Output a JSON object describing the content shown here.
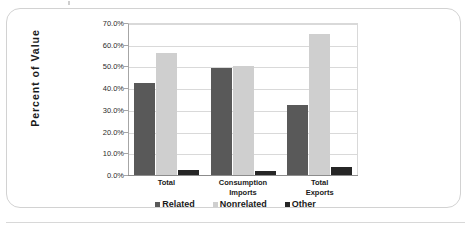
{
  "chart_data": {
    "type": "bar",
    "title": "",
    "subtitle": "",
    "xlabel": "",
    "ylabel": "Percent  of  Value",
    "categories": [
      "Total",
      "Consumption Imports",
      "Total Exports"
    ],
    "category_lines": [
      [
        "Total"
      ],
      [
        "Consumption",
        "Imports"
      ],
      [
        "Total",
        "Exports"
      ]
    ],
    "series": [
      {
        "name": "Related",
        "color": "#595959",
        "values": [
          42.5,
          49.4,
          32.4
        ]
      },
      {
        "name": "Nonrelated",
        "color": "#cfcfcf",
        "values": [
          56.1,
          50.3,
          65.0
        ]
      },
      {
        "name": "Other",
        "color": "#262626",
        "values": [
          2.2,
          1.7,
          3.6
        ]
      }
    ],
    "ylim": [
      0,
      70
    ],
    "ytick_values": [
      0,
      10,
      20,
      30,
      40,
      50,
      60,
      70
    ],
    "ytick_labels": [
      "0.0%",
      "10.0%",
      "20.0%",
      "30.0%",
      "40.0%",
      "50.0%",
      "60.0%",
      "70.0%"
    ],
    "grid": true,
    "legend_position": "bottom",
    "legend_entries": [
      "Related",
      "Nonrelated",
      "Other"
    ]
  },
  "figure": {
    "frame_border_color": "#d2d2d2",
    "background": "#ffffff",
    "axis_color": "#8c8c8c",
    "gridline_color": "#d9d9d9"
  }
}
